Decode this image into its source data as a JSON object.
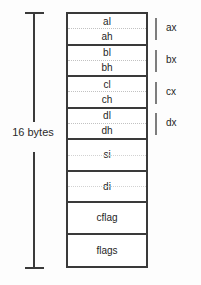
{
  "diagram": {
    "size_label": "16 bytes",
    "colors": {
      "background": "#fdfdfd",
      "box_border": "#3a3a3a",
      "text": "#1f1f1f",
      "dimension_line": "#3a3a3a",
      "bracket_tick": "#7d7d7d",
      "dotted_divider": "#c2c2c2"
    },
    "rows": [
      {
        "type": "split",
        "low": "al",
        "high": "ah"
      },
      {
        "type": "split",
        "low": "bl",
        "high": "bh"
      },
      {
        "type": "split",
        "low": "cl",
        "high": "ch"
      },
      {
        "type": "split",
        "low": "dl",
        "high": "dh"
      },
      {
        "type": "full",
        "label": "si"
      },
      {
        "type": "full",
        "label": "di"
      },
      {
        "type": "full",
        "label": "cflag"
      },
      {
        "type": "full",
        "label": "flags"
      }
    ],
    "brackets": [
      {
        "label": "ax",
        "top": 18
      },
      {
        "label": "bx",
        "top": 50
      },
      {
        "label": "cx",
        "top": 82
      },
      {
        "label": "dx",
        "top": 113
      }
    ]
  }
}
